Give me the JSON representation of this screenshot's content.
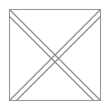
{
  "canvas": {
    "width": 109,
    "height": 109,
    "background_color": "#ffffff",
    "title": "Square with crossed diagonal lattice"
  },
  "figure": {
    "name": "square-diagonal-lattice",
    "shape_count": 5,
    "line_count": 4
  },
  "chart_data": {
    "type": "diagram",
    "title": "",
    "xlabel": "",
    "ylabel": "",
    "xlim": [
      0,
      109
    ],
    "ylim": [
      0,
      109
    ],
    "grid": false,
    "legend": "none",
    "shapes": [
      {
        "id": "border-square",
        "kind": "rect",
        "x": 9,
        "y": 9,
        "width": 91,
        "height": 91,
        "stroke": "#9a9a9a",
        "stroke_width": 1.1,
        "fill": "#ffffff"
      },
      {
        "id": "diagonal-top-left-to-bottom-right",
        "kind": "line",
        "x1": 9,
        "y1": 9,
        "x2": 100,
        "y2": 100,
        "stroke": "#8e8e8e",
        "stroke_width": 1.2
      },
      {
        "id": "diagonal-top-right-to-bottom-left",
        "kind": "line",
        "x1": 100,
        "y1": 9,
        "x2": 9,
        "y2": 100,
        "stroke": "#8e8e8e",
        "stroke_width": 1.2
      },
      {
        "id": "diagonal-left-edge-to-bottom-right",
        "kind": "line",
        "x1": 9,
        "y1": 16,
        "x2": 93,
        "y2": 100,
        "stroke": "#8e8e8e",
        "stroke_width": 1.2
      },
      {
        "id": "diagonal-right-edge-to-bottom-left",
        "kind": "line",
        "x1": 100,
        "y1": 16,
        "x2": 16,
        "y2": 100,
        "stroke": "#8e8e8e",
        "stroke_width": 1.2
      }
    ],
    "vertices": [
      {
        "id": "top-v-vertex",
        "x": 54.5,
        "y": 54.5,
        "label": ""
      },
      {
        "id": "center-crossing-upper",
        "x": 54.5,
        "y": 51,
        "label": ""
      },
      {
        "id": "center-crossing-lower",
        "x": 54.5,
        "y": 58,
        "label": ""
      }
    ],
    "annotations": [],
    "colors": {
      "background": "#ffffff",
      "border_stroke": "#9a9a9a",
      "line_stroke": "#8e8e8e"
    }
  }
}
